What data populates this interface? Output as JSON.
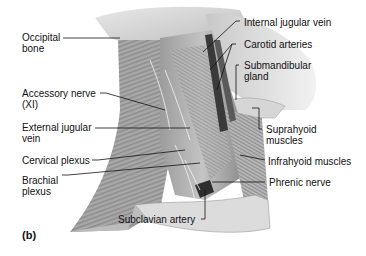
{
  "figure": {
    "panel_label": "(b)",
    "labels_left": [
      {
        "text": "Occipital\nbone",
        "target": "occipital-bone"
      },
      {
        "text": "Accessory nerve\n(XI)",
        "target": "accessory-nerve"
      },
      {
        "text": "External jugular\nvein",
        "target": "external-jugular-vein"
      },
      {
        "text": "Cervical plexus",
        "target": "cervical-plexus"
      },
      {
        "text": "Brachial\nplexus",
        "target": "brachial-plexus"
      }
    ],
    "labels_right": [
      {
        "text": "Internal jugular vein",
        "target": "internal-jugular-vein"
      },
      {
        "text": "Carotid arteries",
        "target": "carotid-arteries"
      },
      {
        "text": "Submandibular\ngland",
        "target": "submandibular-gland"
      },
      {
        "text": "Suprahyoid\nmuscles",
        "target": "suprahyoid-muscles"
      },
      {
        "text": "Infrahyoid muscles",
        "target": "infrahyoid-muscles"
      },
      {
        "text": "Phrenic nerve",
        "target": "phrenic-nerve"
      }
    ],
    "labels_bottom": [
      {
        "text": "Subclavian artery",
        "target": "subclavian-artery"
      }
    ]
  }
}
